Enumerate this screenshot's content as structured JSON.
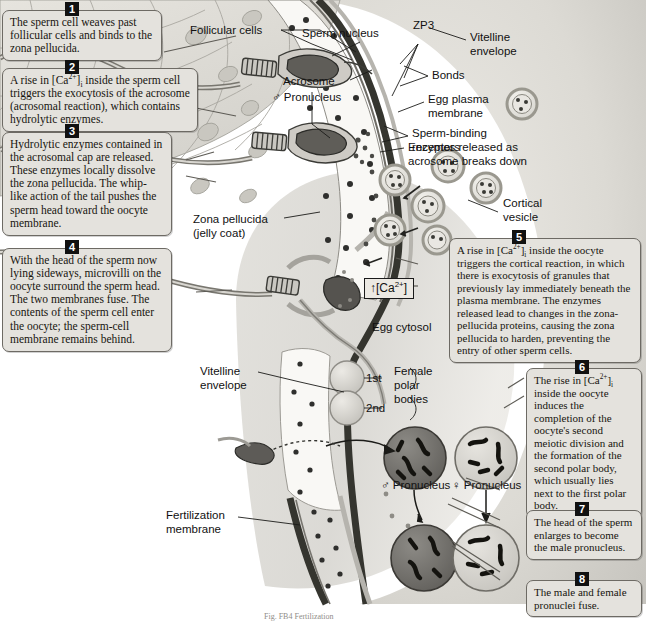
{
  "figure": {
    "caption": "Fig. FB4  Fertilization",
    "colors": {
      "callout_bg": "#e4e2dd",
      "callout_border": "#6d6a64",
      "badge_bg": "#111111",
      "badge_fg": "#ffffff",
      "zona_fill": "#f7f6f2",
      "follicular_fill": "#dedcd6",
      "cytosol_fill": "#d5d3cd",
      "membrane_dark": "#3a3a38",
      "male_pronucleus": "#6b6b6b",
      "female_pronucleus": "#cbc9c3"
    }
  },
  "steps": [
    {
      "number": "1",
      "text": "The sperm cell weaves past follicular cells and binds to the zona pellucida."
    },
    {
      "number": "2",
      "text": "A rise in [Ca2+]i inside the sperm cell triggers the exocytosis of the acrosome (acrosomal reaction), which contains hydrolytic enzymes."
    },
    {
      "number": "3",
      "text": "Hydrolytic enzymes contained in the acrosomal cap are released. These enzymes locally dissolve the zona pellucida. The whip-like action of the tail pushes the sperm head toward the oocyte membrane."
    },
    {
      "number": "4",
      "text": "With the head of the sperm now lying sideways, microvilli on the oocyte surround the sperm head. The two membranes fuse. The contents of the sperm cell enter the oocyte; the sperm-cell membrane remains behind."
    },
    {
      "number": "5",
      "text": "A rise in [Ca2+]i inside the oocyte triggers the cortical reaction, in which there is exocytosis of granules that previously lay immediately beneath the plasma membrane. The enzymes released lead to changes in the zona-pellucida proteins, causing the zona pellucida to harden, preventing the entry of other sperm cells."
    },
    {
      "number": "6",
      "text": "The rise in [Ca2+]i inside the oocyte induces the completion of the oocyte's second meiotic division and the formation of the second polar body, which usually lies next to the first polar body."
    },
    {
      "number": "7",
      "text": "The head of the sperm enlarges to become the male pronucleus."
    },
    {
      "number": "8",
      "text": "The male and female pronuclei fuse."
    }
  ],
  "labels": {
    "follicular_cells": "Follicular cells",
    "sperm_nucleus": "Sperm nucleus",
    "acrosome": "Acrosome",
    "male_pronucleus_top": "♂ Pronucleus",
    "zp3": "ZP3",
    "vitelline_envelope_top": "Vitelline\nenvelope",
    "bonds": "Bonds",
    "egg_plasma_membrane": "Egg plasma\nmembrane",
    "sperm_binding_receptors": "Sperm-binding\nreceptors",
    "enzymes_released": "Enzymes released as\nacrosome breaks down",
    "cortical_vesicle": "Cortical\nvesicle",
    "zona_pellucida": "Zona pellucida\n(jelly coat)",
    "egg_cytosol": "Egg cytosol",
    "vitelline_envelope_bottom": "Vitelline\nenvelope",
    "polar_body_1st": "1st",
    "polar_body_2nd": "2nd",
    "female_polar_bodies": "Female\npolar\nbodies",
    "male_pronucleus": "♂ Pronucleus",
    "female_pronucleus": "♀ Pronucleus",
    "fertilization_membrane": "Fertilization\nmembrane"
  },
  "ca_box": {
    "arrow": "↑",
    "species": "[Ca",
    "charge": "2+",
    "close": "]"
  }
}
